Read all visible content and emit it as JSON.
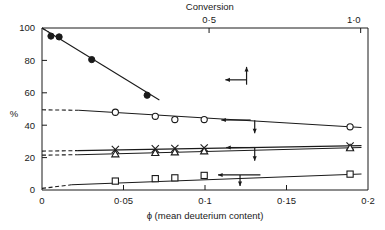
{
  "chart_data": {
    "type": "line",
    "title": "",
    "xlabel": "ϕ (mean deuterium content)",
    "ylabel": "%",
    "xlim": [
      0,
      0.2
    ],
    "ylim": [
      0,
      100
    ],
    "grid": false,
    "legend": "none",
    "x_ticks": [
      "0",
      "0·05",
      "0·1",
      "0·15",
      "0·2"
    ],
    "x_tick_values": [
      0,
      0.05,
      0.1,
      0.15,
      0.2
    ],
    "y_ticks": [
      "0",
      "20",
      "40",
      "60",
      "80",
      "100"
    ],
    "y_tick_values": [
      0,
      20,
      40,
      60,
      80,
      100
    ],
    "secondary_axis": {
      "label": "Conversion",
      "ticks": [
        "0·5",
        "1·0"
      ],
      "tick_values": [
        0.5,
        1.0
      ],
      "tick_positions_phi": [
        0.1025,
        0.1955
      ]
    },
    "series": [
      {
        "name": "filled-circle-series",
        "marker": "filled-circle",
        "axis": "left-arrow-and-up-arrow",
        "points": [
          {
            "x": 0.0055,
            "y": 95.0
          },
          {
            "x": 0.0105,
            "y": 94.5
          },
          {
            "x": 0.0305,
            "y": 80.5
          },
          {
            "x": 0.0645,
            "y": 58.5
          }
        ],
        "fit_line": {
          "x0": 0.0,
          "y0": 100.0,
          "x1": 0.072,
          "y1": 55.5
        },
        "dashed_extrapolation": {
          "x0": 0.0,
          "y0": 100.0,
          "x1": 0.004,
          "y1": 97.5
        }
      },
      {
        "name": "open-circle-series",
        "marker": "open-circle",
        "axis": "left-arrow-and-down-arrow",
        "points": [
          {
            "x": 0.045,
            "y": 48.0
          },
          {
            "x": 0.0695,
            "y": 45.5
          },
          {
            "x": 0.0815,
            "y": 43.5
          },
          {
            "x": 0.0995,
            "y": 43.5
          },
          {
            "x": 0.189,
            "y": 39.0
          }
        ],
        "fit_line": {
          "x0": 0.0225,
          "y0": 49.2,
          "x1": 0.196,
          "y1": 38.6
        },
        "dashed_extrapolation": {
          "x0": 0.0,
          "y0": 49.5,
          "x1": 0.0225,
          "y1": 49.2
        }
      },
      {
        "name": "cross-series",
        "marker": "cross-x",
        "axis": "left-arrow-and-down-arrow",
        "points": [
          {
            "x": 0.045,
            "y": 25.0
          },
          {
            "x": 0.0695,
            "y": 25.5
          },
          {
            "x": 0.0815,
            "y": 25.7
          },
          {
            "x": 0.0995,
            "y": 26.0
          },
          {
            "x": 0.189,
            "y": 27.2
          }
        ],
        "fit_line": {
          "x0": 0.022,
          "y0": 24.3,
          "x1": 0.196,
          "y1": 27.4
        },
        "dashed_extrapolation": {
          "x0": 0.0,
          "y0": 24.0,
          "x1": 0.022,
          "y1": 24.3
        }
      },
      {
        "name": "open-triangle-series",
        "marker": "open-triangle",
        "axis": "left-arrow-and-down-arrow",
        "points": [
          {
            "x": 0.045,
            "y": 22.2
          },
          {
            "x": 0.0695,
            "y": 23.0
          },
          {
            "x": 0.0815,
            "y": 23.4
          },
          {
            "x": 0.0995,
            "y": 24.0
          },
          {
            "x": 0.189,
            "y": 26.0
          }
        ],
        "fit_line": {
          "x0": 0.022,
          "y0": 21.8,
          "x1": 0.196,
          "y1": 26.2
        },
        "dashed_extrapolation": {
          "x0": 0.0,
          "y0": 21.5,
          "x1": 0.022,
          "y1": 21.8
        }
      },
      {
        "name": "open-square-series",
        "marker": "open-square",
        "axis": "left-arrow-and-down-arrow",
        "points": [
          {
            "x": 0.045,
            "y": 5.5
          },
          {
            "x": 0.0695,
            "y": 7.0
          },
          {
            "x": 0.0815,
            "y": 7.5
          },
          {
            "x": 0.0995,
            "y": 9.0
          },
          {
            "x": 0.189,
            "y": 9.8
          }
        ],
        "fit_line": {
          "x0": 0.018,
          "y0": 3.2,
          "x1": 0.196,
          "y1": 9.9
        },
        "dashed_extrapolation": {
          "x0": 0.0,
          "y0": 1.0,
          "x1": 0.018,
          "y1": 3.2
        }
      }
    ],
    "annotations": [
      {
        "name": "up-arrow-top-series",
        "type": "arrow-up",
        "x": 0.1255,
        "y_top": 76.0,
        "y_bottom": 65.0
      },
      {
        "name": "left-arrow-top-series",
        "type": "arrow-left",
        "y": 68.0,
        "x_from": 0.1255,
        "x_to": 0.1125
      },
      {
        "name": "left-arrow-circle-series",
        "type": "arrow-left",
        "y": 43.2,
        "x_from": 0.128,
        "x_to": 0.11
      },
      {
        "name": "down-arrow-circle-series",
        "type": "arrow-down",
        "x": 0.1305,
        "y_top": 43.0,
        "y_bottom": 35.0
      },
      {
        "name": "left-arrow-cross-series",
        "type": "arrow-left",
        "y": 26.2,
        "x_from": 0.131,
        "x_to": 0.113
      },
      {
        "name": "down-arrow-cross-series",
        "type": "arrow-down",
        "x": 0.1305,
        "y_top": 26.0,
        "y_bottom": 18.0
      },
      {
        "name": "left-arrow-square-series",
        "type": "arrow-left",
        "y": 9.3,
        "x_from": 0.134,
        "x_to": 0.108
      },
      {
        "name": "down-arrow-square-series",
        "type": "arrow-down",
        "x": 0.1215,
        "y_top": 9.2,
        "y_bottom": 2.5
      }
    ],
    "colors": {
      "ink": "#1a1a1a",
      "background": "#ffffff"
    }
  }
}
